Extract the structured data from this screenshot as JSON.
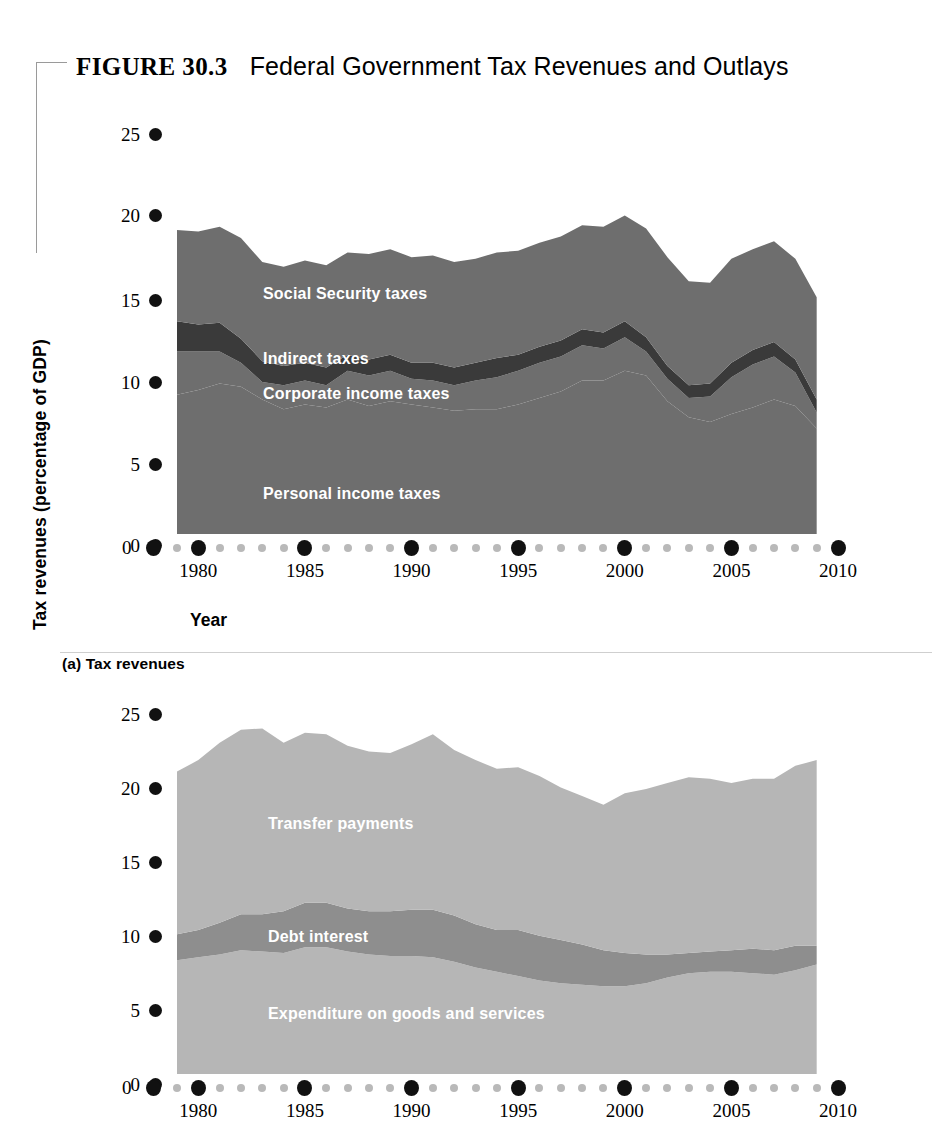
{
  "figure": {
    "tag": "FIGURE  30.3",
    "title": "Federal Government Tax Revenues and Outlays"
  },
  "panels": {
    "a": {
      "caption": "(a) Tax revenues",
      "ylabel": "Tax revenues (percentage of GDP)",
      "xlabel": "Year",
      "zero_label": "0",
      "yticks": [
        "25",
        "20",
        "15",
        "10",
        "5",
        "0"
      ],
      "xticks": [
        "1980",
        "1985",
        "1990",
        "1995",
        "2000",
        "2005",
        "2010"
      ],
      "series_labels": {
        "social_security": "Social Security taxes",
        "indirect": "Indirect taxes",
        "corporate": "Corporate income taxes",
        "personal": "Personal income taxes"
      }
    },
    "b": {
      "caption": "(b) Outlays",
      "ylabel": "Outlays (percentage of GDP)",
      "xlabel": "Year",
      "zero_label": "0",
      "yticks": [
        "25",
        "20",
        "15",
        "10",
        "5",
        "0"
      ],
      "xticks": [
        "1980",
        "1985",
        "1990",
        "1995",
        "2000",
        "2005",
        "2010"
      ],
      "series_labels": {
        "transfer": "Transfer payments",
        "debt_interest": "Debt interest",
        "expenditure": "Expenditure on goods and services"
      }
    }
  },
  "colors": {
    "personal_income_taxes": "#6e6e6e",
    "corporate_income_taxes": "#6e6e6e",
    "indirect_taxes": "#3a3a3a",
    "social_security_taxes": "#6e6e6e",
    "expenditure_goods_services": "#b6b6b6",
    "debt_interest": "#8e8e8e",
    "transfer_payments": "#b6b6b6",
    "tick_major": "#111111",
    "tick_minor": "#b9b9b9",
    "label_text": "#ffffff"
  },
  "chart_data": [
    {
      "type": "area",
      "id": "tax-revenues",
      "title": "(a) Tax revenues",
      "xlabel": "Year",
      "ylabel": "Tax revenues (percentage of GDP)",
      "xlim": [
        1979,
        2010
      ],
      "ylim": [
        0,
        25
      ],
      "ytick_values": [
        0,
        5,
        10,
        15,
        20,
        25
      ],
      "xtick_values": [
        1980,
        1985,
        1990,
        1995,
        2000,
        2005,
        2010
      ],
      "grid": false,
      "legend": "in-chart labels",
      "stacked": true,
      "x": [
        1979,
        1980,
        1981,
        1982,
        1983,
        1984,
        1985,
        1986,
        1987,
        1988,
        1989,
        1990,
        1991,
        1992,
        1993,
        1994,
        1995,
        1996,
        1997,
        1998,
        1999,
        2000,
        2001,
        2002,
        2003,
        2004,
        2005,
        2006,
        2007,
        2008,
        2009
      ],
      "series": [
        {
          "name": "Personal income taxes",
          "values": [
            8.7,
            9.0,
            9.4,
            9.2,
            8.4,
            7.8,
            8.1,
            7.9,
            8.4,
            8.0,
            8.3,
            8.1,
            7.9,
            7.7,
            7.8,
            7.8,
            8.1,
            8.5,
            8.9,
            9.6,
            9.6,
            10.2,
            9.9,
            8.3,
            7.3,
            7.0,
            7.5,
            7.9,
            8.4,
            8.0,
            6.6
          ]
        },
        {
          "name": "Corporate income taxes",
          "values": [
            2.7,
            2.4,
            2.0,
            1.5,
            1.1,
            1.5,
            1.5,
            1.4,
            1.8,
            1.9,
            1.9,
            1.6,
            1.7,
            1.6,
            1.8,
            2.0,
            2.1,
            2.2,
            2.2,
            2.2,
            2.0,
            2.1,
            1.5,
            1.4,
            1.2,
            1.6,
            2.3,
            2.7,
            2.7,
            2.1,
            1.0
          ]
        },
        {
          "name": "Indirect taxes",
          "values": [
            1.9,
            1.7,
            1.8,
            1.5,
            1.3,
            1.2,
            1.1,
            1.1,
            1.0,
            1.0,
            1.0,
            1.0,
            1.1,
            1.1,
            1.1,
            1.2,
            1.0,
            1.0,
            1.0,
            1.0,
            1.0,
            1.0,
            0.9,
            0.8,
            0.8,
            0.8,
            0.9,
            0.9,
            0.9,
            0.8,
            0.8
          ]
        },
        {
          "name": "Social Security taxes",
          "values": [
            5.7,
            5.8,
            6.0,
            6.3,
            6.2,
            6.2,
            6.4,
            6.4,
            6.4,
            6.6,
            6.6,
            6.6,
            6.7,
            6.6,
            6.5,
            6.6,
            6.5,
            6.5,
            6.5,
            6.5,
            6.6,
            6.6,
            6.8,
            6.8,
            6.5,
            6.3,
            6.5,
            6.3,
            6.3,
            6.3,
            6.4
          ]
        }
      ],
      "notes": "Stacked shares sum to total tax revenues: ~19% in 1979, ~20% in 1981, dip to ~17.5% in 1983-84, ~18.5% mid-1990s, peak ~21% in 2000, trough ~17.3% in 2003-04, ~19.3% in 2007, ~18.8% at end of data (2009)."
    },
    {
      "type": "area",
      "id": "outlays",
      "title": "(b) Outlays",
      "xlabel": "Year",
      "ylabel": "Outlays (percentage of GDP)",
      "xlim": [
        1979,
        2010
      ],
      "ylim": [
        0,
        25
      ],
      "ytick_values": [
        0,
        5,
        10,
        15,
        20,
        25
      ],
      "xtick_values": [
        1980,
        1985,
        1990,
        1995,
        2000,
        2005,
        2010
      ],
      "grid": false,
      "legend": "in-chart labels",
      "stacked": true,
      "x": [
        1979,
        1980,
        1981,
        1982,
        1983,
        1984,
        1985,
        1986,
        1987,
        1988,
        1989,
        1990,
        1991,
        1992,
        1993,
        1994,
        1995,
        1996,
        1997,
        1998,
        1999,
        2000,
        2001,
        2002,
        2003,
        2004,
        2005,
        2006,
        2007,
        2008,
        2009
      ],
      "series": [
        {
          "name": "Expenditure on goods and services",
          "values": [
            7.9,
            8.1,
            8.3,
            8.6,
            8.5,
            8.4,
            8.8,
            8.8,
            8.5,
            8.3,
            8.2,
            8.2,
            8.1,
            7.8,
            7.4,
            7.1,
            6.8,
            6.5,
            6.3,
            6.2,
            6.1,
            6.1,
            6.3,
            6.7,
            7.0,
            7.1,
            7.1,
            7.0,
            6.9,
            7.2,
            7.6
          ]
        },
        {
          "name": "Debt interest",
          "values": [
            1.8,
            1.9,
            2.2,
            2.5,
            2.6,
            2.9,
            3.1,
            3.1,
            3.0,
            3.0,
            3.1,
            3.2,
            3.3,
            3.2,
            3.0,
            2.9,
            3.2,
            3.1,
            3.0,
            2.8,
            2.5,
            2.3,
            2.0,
            1.6,
            1.4,
            1.4,
            1.5,
            1.7,
            1.7,
            1.7,
            1.3
          ]
        },
        {
          "name": "Transfer payments",
          "values": [
            11.3,
            11.8,
            12.5,
            12.8,
            12.9,
            11.7,
            11.8,
            11.7,
            11.3,
            11.1,
            11.0,
            11.5,
            12.2,
            11.5,
            11.4,
            11.2,
            11.3,
            11.1,
            10.6,
            10.3,
            10.1,
            11.1,
            11.5,
            11.9,
            12.2,
            12.0,
            11.6,
            11.8,
            11.9,
            12.5,
            12.9
          ]
        }
      ],
      "notes": "Total outlays: ~21% in 1979, peak ~24% in 1983, ~22.5% in 1992, trough ~19.5% in 2000, rising to ~21.8% by end of data (2009)."
    }
  ]
}
